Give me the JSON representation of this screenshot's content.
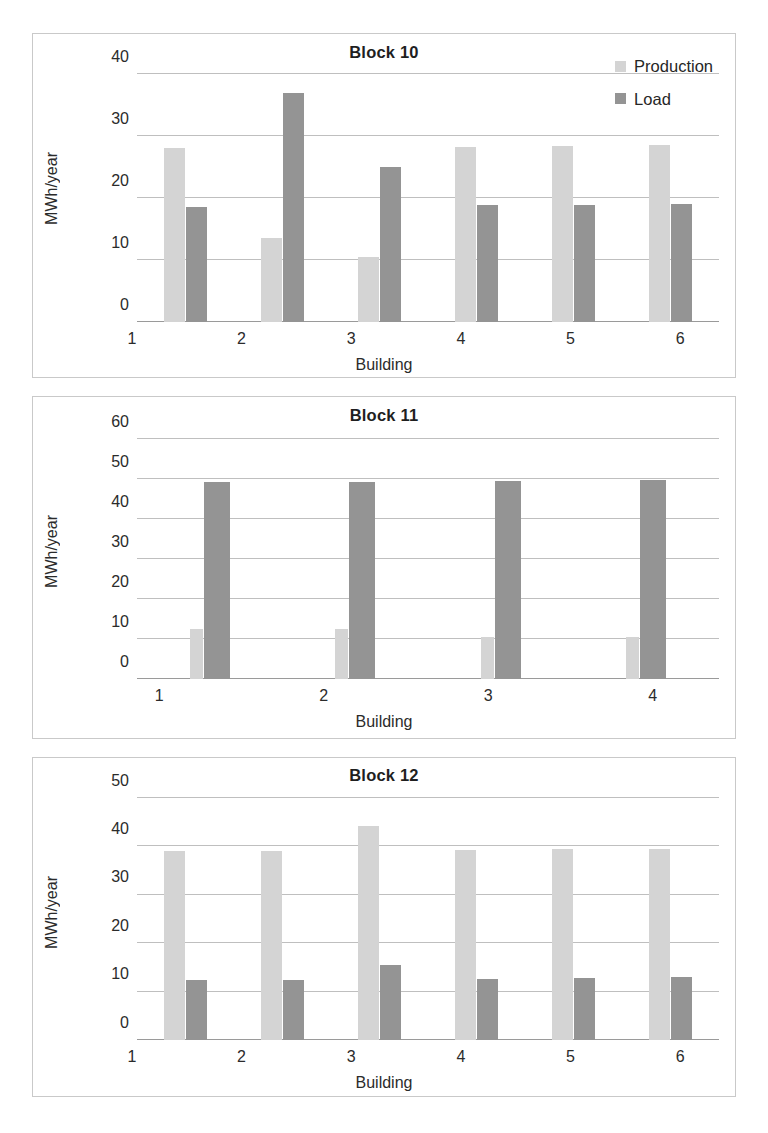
{
  "legend": {
    "production_label": "Production",
    "load_label": "Load",
    "production_color": "#d4d4d4",
    "load_color": "#949494"
  },
  "axis": {
    "ylabel": "MWh/year",
    "xlabel": "Building"
  },
  "chart_data": [
    {
      "type": "bar",
      "title": "Block 10",
      "xlabel": "Building",
      "ylabel": "MWh/year",
      "categories": [
        "1",
        "2",
        "3",
        "4",
        "5",
        "6"
      ],
      "ylim": [
        0,
        40
      ],
      "yticks": [
        0,
        10,
        20,
        30,
        40
      ],
      "grid": true,
      "legend_position": "top-right",
      "series": [
        {
          "name": "Production",
          "values": [
            28.0,
            13.6,
            10.5,
            28.3,
            28.4,
            28.6
          ]
        },
        {
          "name": "Load",
          "values": [
            18.6,
            37.0,
            25.0,
            18.8,
            18.9,
            19.0
          ]
        }
      ]
    },
    {
      "type": "bar",
      "title": "Block 11",
      "xlabel": "Building",
      "ylabel": "MWh/year",
      "categories": [
        "1",
        "2",
        "3",
        "4"
      ],
      "ylim": [
        0,
        60
      ],
      "yticks": [
        0,
        10,
        20,
        30,
        40,
        50,
        60
      ],
      "grid": true,
      "legend_position": "none",
      "series": [
        {
          "name": "Production",
          "values": [
            12.5,
            12.5,
            10.4,
            10.6
          ]
        },
        {
          "name": "Load",
          "values": [
            49.2,
            49.3,
            49.5,
            49.7
          ]
        }
      ]
    },
    {
      "type": "bar",
      "title": "Block 12",
      "xlabel": "Building",
      "ylabel": "MWh/year",
      "categories": [
        "1",
        "2",
        "3",
        "4",
        "5",
        "6"
      ],
      "ylim": [
        0,
        50
      ],
      "yticks": [
        0,
        10,
        20,
        30,
        40,
        50
      ],
      "grid": true,
      "legend_position": "none",
      "series": [
        {
          "name": "Production",
          "values": [
            39.0,
            39.1,
            44.2,
            39.2,
            39.4,
            39.5
          ]
        },
        {
          "name": "Load",
          "values": [
            12.3,
            12.4,
            15.5,
            12.7,
            12.9,
            13.0
          ]
        }
      ]
    }
  ]
}
